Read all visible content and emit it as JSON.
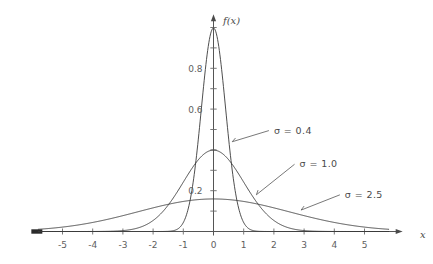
{
  "chart_data": {
    "type": "line",
    "title": "",
    "subtitle": "",
    "xlabel": "x",
    "ylabel": "f(x)",
    "xlim": [
      -5.8,
      5.8
    ],
    "ylim": [
      0,
      1.05
    ],
    "grid": false,
    "legend_position": "inline-annotations",
    "x_ticks": [
      -5,
      -4,
      -3,
      -2,
      -1,
      0,
      1,
      2,
      3,
      4,
      5
    ],
    "x_tick_labels": [
      "-5",
      "-4",
      "-3",
      "-2",
      "-1",
      "0",
      "1",
      "2",
      "3",
      "4",
      "5"
    ],
    "y_ticks": [
      0.2,
      0.6,
      0.8
    ],
    "y_tick_labels": [
      "0.2",
      "0.6",
      "0.8"
    ],
    "y_minor_ticks": [
      0.1,
      0.2,
      0.3,
      0.4,
      0.5,
      0.6,
      0.7,
      0.8,
      0.9,
      1.0
    ],
    "series": [
      {
        "name": "sigma-0.4",
        "label": "σ = 0.4",
        "mu": 0,
        "sigma": 0.4,
        "peak_value": 0.997,
        "annotation": {
          "text": "σ = 0.4",
          "text_x": 2.0,
          "text_y": 0.48,
          "point_x": 0.62,
          "point_y": 0.44
        }
      },
      {
        "name": "sigma-1.0",
        "label": "σ = 1.0",
        "mu": 0,
        "sigma": 1.0,
        "peak_value": 0.399,
        "annotation": {
          "text": "σ = 1.0",
          "text_x": 2.85,
          "text_y": 0.315,
          "point_x": 1.42,
          "point_y": 0.18
        }
      },
      {
        "name": "sigma-2.5",
        "label": "σ = 2.5",
        "mu": 0,
        "sigma": 2.5,
        "peak_value": 0.16,
        "annotation": {
          "text": "σ = 2.5",
          "text_x": 4.35,
          "text_y": 0.165,
          "point_x": 2.9,
          "point_y": 0.105
        }
      }
    ],
    "colors": {
      "background": "#ffffff",
      "curve": "#3a3a3a",
      "axis": "#555555",
      "tick_label": "#5e5e5e",
      "annotation": "#4a4a4a"
    }
  },
  "axes": {
    "x_label": "x",
    "y_label": "f(x)"
  },
  "annotations": {
    "a0": "σ = 0.4",
    "a1": "σ = 1.0",
    "a2": "σ = 2.5"
  },
  "x_tick_labels": {
    "t0": "-5",
    "t1": "-4",
    "t2": "-3",
    "t3": "-2",
    "t4": "-1",
    "t5": "0",
    "t6": "1",
    "t7": "2",
    "t8": "3",
    "t9": "4",
    "t10": "5"
  },
  "y_tick_labels": {
    "t0": "0.8",
    "t1": "0.6",
    "t2": "0.2"
  }
}
